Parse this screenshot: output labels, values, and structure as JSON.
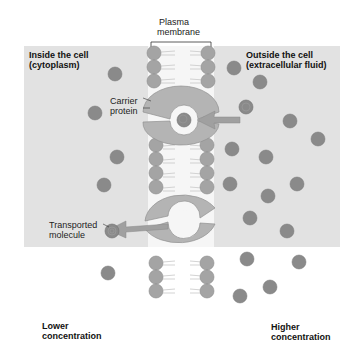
{
  "labels": {
    "plasma_membrane_1": "Plasma",
    "plasma_membrane_2": "membrane",
    "inside_1": "Inside the cell",
    "inside_2": "(cytoplasm)",
    "outside_1": "Outside the cell",
    "outside_2": "(extracellular fluid)",
    "carrier_1": "Carrier",
    "carrier_2": "protein",
    "transported_1": "Transported",
    "transported_2": "molecule",
    "lower_1": "Lower",
    "lower_2": "concentration",
    "higher_1": "Higher",
    "higher_2": "concentration"
  },
  "colors": {
    "molecule": "#8a8a8a",
    "phospholipid_head": "#a4a4a4",
    "carrier": "#b4b4b4",
    "background": "#e2e2e2"
  }
}
